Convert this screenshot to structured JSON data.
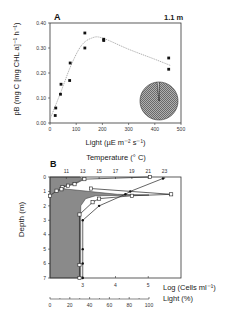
{
  "chart_data": [
    {
      "panel": "A",
      "type": "scatter",
      "annotation": "1.1 m",
      "xlabel": "Light (µE m⁻² s⁻¹)",
      "ylabel": "pB (mg C [mg CHL a]⁻¹ h⁻¹)",
      "xlim": [
        0,
        500
      ],
      "ylim": [
        0,
        0.4
      ],
      "xticks": [
        "0",
        "100",
        "200",
        "300",
        "400",
        "500"
      ],
      "yticks": [
        "0.00",
        "0.10",
        "0.20",
        "0.30",
        "0.40"
      ],
      "points": [
        {
          "x": 20,
          "y": 0.03
        },
        {
          "x": 22,
          "y": 0.06
        },
        {
          "x": 40,
          "y": 0.115
        },
        {
          "x": 42,
          "y": 0.155
        },
        {
          "x": 75,
          "y": 0.17
        },
        {
          "x": 77,
          "y": 0.24
        },
        {
          "x": 133,
          "y": 0.36
        },
        {
          "x": 133,
          "y": 0.3
        },
        {
          "x": 205,
          "y": 0.335
        },
        {
          "x": 205,
          "y": 0.33
        },
        {
          "x": 453,
          "y": 0.26
        },
        {
          "x": 453,
          "y": 0.215
        }
      ],
      "fit_curve": [
        {
          "x": 0,
          "y": 0.015
        },
        {
          "x": 40,
          "y": 0.12
        },
        {
          "x": 80,
          "y": 0.23
        },
        {
          "x": 120,
          "y": 0.31
        },
        {
          "x": 160,
          "y": 0.34
        },
        {
          "x": 200,
          "y": 0.34
        },
        {
          "x": 300,
          "y": 0.295
        },
        {
          "x": 400,
          "y": 0.255
        },
        {
          "x": 460,
          "y": 0.23
        }
      ],
      "inset_pie": {
        "slices": [
          {
            "label": "major",
            "value": 98.5
          },
          {
            "label": "minor",
            "value": 1.5
          }
        ]
      }
    },
    {
      "panel": "B",
      "type": "line",
      "ylabel": "Depth (m)",
      "ylim": [
        7,
        0
      ],
      "yticks": [
        "0",
        "1",
        "2",
        "3",
        "4",
        "5",
        "6",
        "7"
      ],
      "top_axis": {
        "label": "Temperature (° C)",
        "ticks": [
          "11",
          "13",
          "15",
          "17",
          "19",
          "21",
          "23"
        ],
        "range": [
          9,
          25
        ]
      },
      "bottom_axis": {
        "label": "Log (Cells ml⁻¹)",
        "ticks": [
          "3",
          "4",
          "5"
        ],
        "range": [
          2,
          6
        ]
      },
      "light_axis": {
        "label": "Light (%)",
        "ticks": [
          "0",
          "20",
          "40",
          "60",
          "80",
          "100"
        ],
        "range": [
          0,
          100
        ]
      },
      "series": [
        {
          "name": "Temperature",
          "marker": "filled-dot",
          "points": [
            {
              "value": 22.8,
              "depth": 0.1
            },
            {
              "value": 18.8,
              "depth": 1.0
            },
            {
              "value": 18.2,
              "depth": 1.2
            },
            {
              "value": 15.0,
              "depth": 2.0
            },
            {
              "value": 13.0,
              "depth": 3.0
            },
            {
              "value": 13.0,
              "depth": 5.0
            },
            {
              "value": 13.0,
              "depth": 6.0
            },
            {
              "value": 13.0,
              "depth": 7.0
            }
          ]
        },
        {
          "name": "Log cells (upper)",
          "marker": "open-square",
          "points": [
            {
              "value": 5.05,
              "depth": 0.0
            },
            {
              "value": 3.05,
              "depth": 0.15
            },
            {
              "value": 2.75,
              "depth": 0.5
            },
            {
              "value": 2.55,
              "depth": 0.6
            },
            {
              "value": 2.38,
              "depth": 0.7
            },
            {
              "value": 2.35,
              "depth": 0.85
            },
            {
              "value": 2.2,
              "depth": 0.95
            },
            {
              "value": 2.0,
              "depth": 1.3
            }
          ]
        },
        {
          "name": "Log cells (lower)",
          "marker": "open-square",
          "points": [
            {
              "value": 3.25,
              "depth": 0.8
            },
            {
              "value": 5.7,
              "depth": 1.2
            },
            {
              "value": 4.5,
              "depth": 1.3
            },
            {
              "value": 3.5,
              "depth": 1.5
            },
            {
              "value": 3.3,
              "depth": 1.75
            },
            {
              "value": 2.9,
              "depth": 2.6
            },
            {
              "value": 2.9,
              "depth": 6.1
            },
            {
              "value": 2.9,
              "depth": 7.0
            }
          ]
        }
      ],
      "shaded_light_profile": [
        {
          "light": 0,
          "depth": 0
        },
        {
          "light": 30,
          "depth": 0
        },
        {
          "light": 33,
          "depth": 0.15
        },
        {
          "light": 25,
          "depth": 0.45
        },
        {
          "light": 12,
          "depth": 0.7
        },
        {
          "light": 11,
          "depth": 0.8
        },
        {
          "light": 68,
          "depth": 1.2
        },
        {
          "light": 100,
          "depth": 1.25
        },
        {
          "light": 46,
          "depth": 1.3
        },
        {
          "light": 36,
          "depth": 1.5
        },
        {
          "light": 31,
          "depth": 2.0
        },
        {
          "light": 31,
          "depth": 2.6
        },
        {
          "light": 31,
          "depth": 7.0
        },
        {
          "light": 0,
          "depth": 7.0
        }
      ]
    }
  ]
}
